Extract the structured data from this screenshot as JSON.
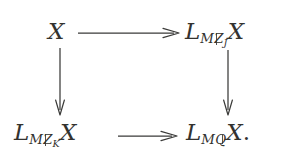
{
  "figure": {
    "kind": "commutative-diagram",
    "shape": "2x2 square",
    "background_color": "#ffffff",
    "ink_color": "#33322f",
    "nodes": {
      "top_left": {
        "id": "top-left",
        "text": "X",
        "base": "X",
        "subscript": "",
        "trailing": ""
      },
      "top_right": {
        "id": "top-right",
        "text": "L_{Mℤ_J}X",
        "base": "L",
        "subscript_main": "M",
        "subscript_blackboard": "Z",
        "subscript_nested": "J",
        "argument": "X",
        "trailing": ""
      },
      "bottom_left": {
        "id": "bottom-left",
        "text": "L_{Mℤ_K}X",
        "base": "L",
        "subscript_main": "M",
        "subscript_blackboard": "Z",
        "subscript_nested": "K",
        "argument": "X",
        "trailing": ""
      },
      "bottom_right": {
        "id": "bottom-right",
        "text": "L_{Mℚ}X.",
        "base": "L",
        "subscript_main": "M",
        "subscript_blackboard": "Q",
        "subscript_nested": "",
        "argument": "X",
        "trailing": "."
      }
    },
    "arrows": [
      {
        "id": "arrow-top",
        "label": "",
        "from": "top-left",
        "to": "top-right",
        "direction": "right",
        "style": "solid"
      },
      {
        "id": "arrow-left",
        "label": "",
        "from": "top-left",
        "to": "bottom-left",
        "direction": "down",
        "style": "solid"
      },
      {
        "id": "arrow-right",
        "label": "",
        "from": "top-right",
        "to": "bottom-right",
        "direction": "down",
        "style": "solid"
      },
      {
        "id": "arrow-bottom",
        "label": "",
        "from": "bottom-left",
        "to": "bottom-right",
        "direction": "right",
        "style": "solid"
      }
    ]
  }
}
